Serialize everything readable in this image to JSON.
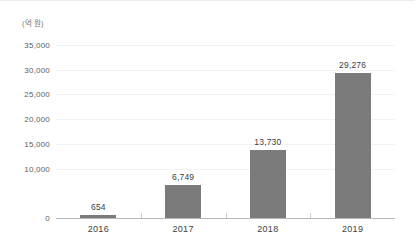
{
  "chart_data": {
    "type": "bar",
    "title": "",
    "subtitle": "",
    "unit_caption": "(억 원)",
    "xlabel": "",
    "ylabel": "",
    "categories": [
      "2016",
      "2017",
      "2018",
      "2019"
    ],
    "values": [
      654,
      6749,
      13730,
      29276
    ],
    "value_labels": [
      "654",
      "6,749",
      "13,730",
      "29,276"
    ],
    "ylim": [
      0,
      37000
    ],
    "yticks": [
      0,
      10000,
      15000,
      20000,
      25000,
      30000,
      35000
    ],
    "ytick_labels": [
      "0",
      "10,000",
      "15,000",
      "20,000",
      "25,000",
      "30,000",
      "35,000"
    ],
    "grid": true,
    "grid_axis": "y",
    "legend": false,
    "legend_position": "none",
    "series": [
      {
        "name": "",
        "values": [
          654,
          6749,
          13730,
          29276
        ]
      }
    ],
    "colors": {
      "bar": "#7b7b7b",
      "gridline": "#f3f3f3",
      "axis": "#b9b9b9",
      "tick_label": "#5e5e5e",
      "value_label": "#3d3d3d",
      "category_label": "#3d3d3d",
      "background": "#ffffff"
    }
  }
}
